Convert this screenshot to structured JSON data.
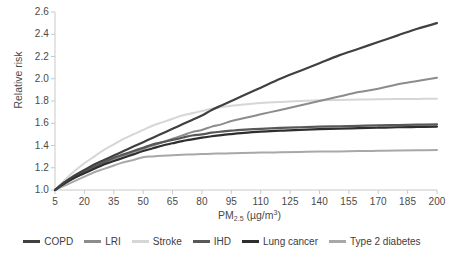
{
  "chart_data": {
    "type": "line",
    "title": "",
    "subtitle": "",
    "xlabel": "PM2.5 (µg/m³)",
    "xlabel_base": "PM",
    "xlabel_sub": "2.5",
    "xlabel_unit": "(µg/m",
    "xlabel_unit_sup": "3",
    "xlabel_unit_close": ")",
    "ylabel": "Relative risk",
    "xlim": [
      5,
      200
    ],
    "ylim": [
      1.0,
      2.6
    ],
    "grid": false,
    "legend_position": "bottom",
    "xticks": [
      5,
      20,
      35,
      50,
      65,
      80,
      95,
      110,
      125,
      140,
      155,
      170,
      185,
      200
    ],
    "xtick_labels": [
      "5",
      "20",
      "35",
      "50",
      "65",
      "80",
      "95",
      "110",
      "125",
      "140",
      "155",
      "170",
      "185",
      "200"
    ],
    "yticks": [
      1.0,
      1.2,
      1.4,
      1.6,
      1.8,
      2.0,
      2.2,
      2.4,
      2.6
    ],
    "ytick_labels": [
      "1.0",
      "1.2",
      "1.4",
      "1.6",
      "1.8",
      "2.0",
      "2.2",
      "2.4",
      "2.6"
    ],
    "x": [
      5,
      10,
      15,
      20,
      25,
      30,
      35,
      40,
      45,
      50,
      55,
      60,
      65,
      70,
      75,
      80,
      85,
      90,
      95,
      100,
      110,
      120,
      130,
      140,
      150,
      160,
      170,
      180,
      190,
      200
    ],
    "series": [
      {
        "name": "COPD",
        "color": "#404040",
        "width": 2.2,
        "values": [
          1.0,
          1.07,
          1.13,
          1.18,
          1.23,
          1.27,
          1.31,
          1.35,
          1.39,
          1.43,
          1.47,
          1.51,
          1.55,
          1.59,
          1.63,
          1.67,
          1.72,
          1.76,
          1.8,
          1.84,
          1.92,
          2.0,
          2.07,
          2.14,
          2.21,
          2.27,
          2.33,
          2.39,
          2.45,
          2.5
        ]
      },
      {
        "name": "LRI",
        "color": "#8c8c8c",
        "width": 2.0,
        "values": [
          1.0,
          1.06,
          1.11,
          1.16,
          1.2,
          1.24,
          1.28,
          1.31,
          1.34,
          1.37,
          1.4,
          1.43,
          1.46,
          1.49,
          1.52,
          1.54,
          1.57,
          1.59,
          1.62,
          1.64,
          1.68,
          1.72,
          1.76,
          1.8,
          1.84,
          1.88,
          1.91,
          1.95,
          1.98,
          2.01
        ]
      },
      {
        "name": "Stroke",
        "color": "#d6d6d6",
        "width": 2.0,
        "values": [
          1.0,
          1.09,
          1.17,
          1.24,
          1.3,
          1.36,
          1.41,
          1.46,
          1.5,
          1.54,
          1.58,
          1.61,
          1.64,
          1.67,
          1.69,
          1.71,
          1.73,
          1.745,
          1.757,
          1.767,
          1.782,
          1.792,
          1.8,
          1.806,
          1.81,
          1.813,
          1.816,
          1.818,
          1.819,
          1.82
        ]
      },
      {
        "name": "IHD",
        "color": "#585858",
        "width": 2.2,
        "values": [
          1.0,
          1.07,
          1.12,
          1.17,
          1.21,
          1.25,
          1.29,
          1.32,
          1.35,
          1.38,
          1.41,
          1.43,
          1.45,
          1.47,
          1.49,
          1.5,
          1.515,
          1.525,
          1.533,
          1.54,
          1.55,
          1.558,
          1.564,
          1.569,
          1.573,
          1.577,
          1.581,
          1.584,
          1.587,
          1.59
        ]
      },
      {
        "name": "Lung cancer",
        "color": "#2e2e2e",
        "width": 2.2,
        "values": [
          1.0,
          1.06,
          1.11,
          1.15,
          1.19,
          1.23,
          1.26,
          1.29,
          1.32,
          1.35,
          1.375,
          1.4,
          1.42,
          1.44,
          1.455,
          1.47,
          1.483,
          1.494,
          1.503,
          1.511,
          1.524,
          1.533,
          1.541,
          1.547,
          1.552,
          1.556,
          1.56,
          1.564,
          1.567,
          1.57
        ]
      },
      {
        "name": "Type 2 diabetes",
        "color": "#a8a8a8",
        "width": 2.0,
        "values": [
          1.0,
          1.04,
          1.08,
          1.12,
          1.16,
          1.19,
          1.22,
          1.25,
          1.27,
          1.295,
          1.302,
          1.308,
          1.313,
          1.317,
          1.32,
          1.323,
          1.326,
          1.328,
          1.33,
          1.332,
          1.336,
          1.339,
          1.342,
          1.345,
          1.347,
          1.35,
          1.352,
          1.354,
          1.357,
          1.36
        ]
      }
    ]
  },
  "legend": {
    "items": [
      {
        "label": "COPD",
        "color": "#404040"
      },
      {
        "label": "LRI",
        "color": "#8c8c8c"
      },
      {
        "label": "Stroke",
        "color": "#d6d6d6"
      },
      {
        "label": "IHD",
        "color": "#585858"
      },
      {
        "label": "Lung cancer",
        "color": "#2e2e2e"
      },
      {
        "label": "Type 2 diabetes",
        "color": "#a8a8a8"
      }
    ]
  },
  "axis_style": {
    "axis_color": "#c9c9c9",
    "tick_color": "#c9c9c9",
    "label_color": "#4a4a4a"
  }
}
